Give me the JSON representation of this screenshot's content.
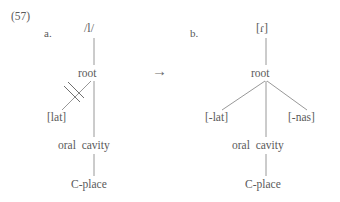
{
  "figure": {
    "example_number": "(57)",
    "arrow": "→",
    "arrow_icon_name": "rightwards-arrow-icon"
  },
  "tree_a": {
    "sub_label": "a.",
    "segment": "/l/",
    "nodes": {
      "root": "root",
      "oral_cavity": "oral  cavity",
      "c_place": "C-place"
    },
    "features": {
      "lat": "[lat]"
    },
    "delink": {
      "name": "delink-strike",
      "description": "double strike through association line"
    }
  },
  "tree_b": {
    "sub_label": "b.",
    "segment": "[ɾ]",
    "nodes": {
      "root": "root",
      "oral_cavity": "oral  cavity",
      "c_place": "C-place"
    },
    "features": {
      "minus_lat": "[-lat]",
      "minus_nas": "[-nas]"
    }
  },
  "colors": {
    "background": "#ffffff",
    "text": "#5a5a5a",
    "line": "#8c8c8c",
    "strike": "#6e6e6e"
  }
}
